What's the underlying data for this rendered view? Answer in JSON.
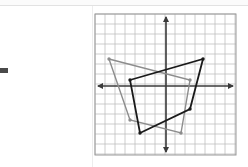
{
  "document": {
    "type": "coordinate-plane-figure",
    "background_color": "#ffffff",
    "left_page_visible": true
  },
  "graph": {
    "name": "coordinate-plane",
    "grid": {
      "visible": true,
      "cell_size_px": 10,
      "line_color": "#b8b8b8",
      "border_color": "#9a9a9a",
      "columns": 14,
      "rows": 14,
      "x_range": [
        -7,
        7
      ],
      "y_range": [
        -7,
        7
      ]
    },
    "axes": {
      "color": "#3a3a3a",
      "x_axis_label": "",
      "y_axis_label": "",
      "arrows": true,
      "origin_px": [
        72,
        73
      ],
      "tick_labels_visible": false
    },
    "shapes": [
      {
        "name": "preimage-quadrilateral",
        "color": "#8c8c8c",
        "stroke_width": 1.4,
        "closed": true,
        "vertex_marker": "dot",
        "vertices": [
          {
            "x": -5.7,
            "y": 2.7
          },
          {
            "x": 2.4,
            "y": 0.6
          },
          {
            "x": 1.5,
            "y": -4.7
          },
          {
            "x": -3.6,
            "y": -3.4
          }
        ]
      },
      {
        "name": "image-quadrilateral",
        "color": "#1a1a1a",
        "stroke_width": 1.8,
        "closed": true,
        "vertex_marker": "dot",
        "vertices": [
          {
            "x": -3.6,
            "y": 0.6
          },
          {
            "x": 3.7,
            "y": 2.7
          },
          {
            "x": 2.4,
            "y": -2.3
          },
          {
            "x": -2.6,
            "y": -4.7
          }
        ]
      }
    ]
  }
}
